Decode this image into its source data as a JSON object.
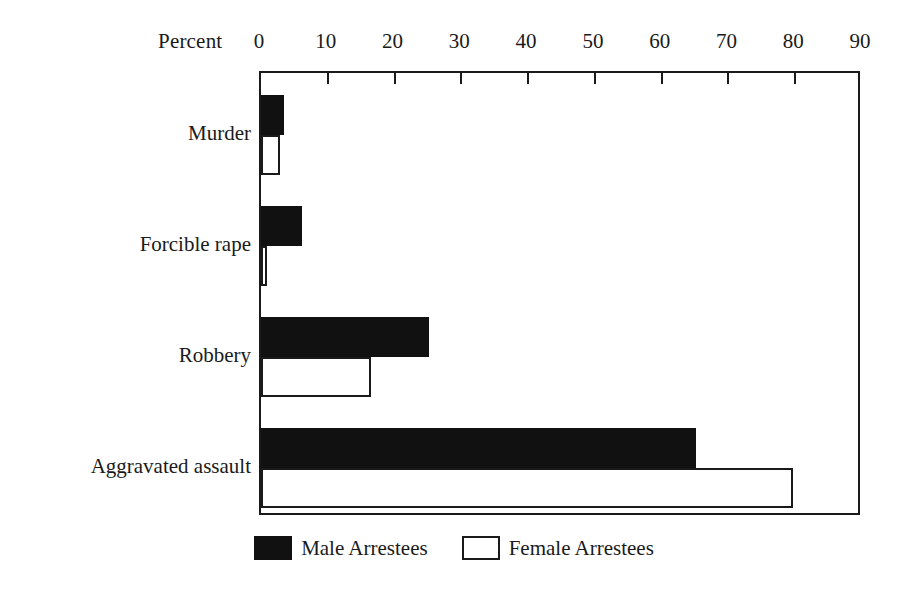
{
  "chart_data": {
    "type": "bar",
    "orientation": "horizontal",
    "title": "",
    "xlabel": "Percent",
    "ylabel": "",
    "xlim": [
      0,
      90
    ],
    "xticks": [
      0,
      10,
      20,
      30,
      40,
      50,
      60,
      70,
      80,
      90
    ],
    "xtick_labels": [
      "0",
      "10",
      "20",
      "30",
      "40",
      "50",
      "60",
      "70",
      "80",
      "90"
    ],
    "grid": false,
    "legend_position": "bottom",
    "categories": [
      "Murder",
      "Forcible rape",
      "Robbery",
      "Aggravated assault"
    ],
    "series": [
      {
        "name": "Male Arrestees",
        "color": "#111111",
        "values": [
          3.4,
          6.1,
          25.2,
          65.2
        ]
      },
      {
        "name": "Female Arrestees",
        "color": "#ffffff",
        "values": [
          2.9,
          0.9,
          16.4,
          79.7
        ]
      }
    ]
  },
  "axis": {
    "title": "Percent"
  },
  "legend": {
    "items": [
      {
        "label": "Male Arrestees",
        "swatch": "filled-black-swatch-icon"
      },
      {
        "label": "Female Arrestees",
        "swatch": "outlined-white-swatch-icon"
      }
    ]
  }
}
